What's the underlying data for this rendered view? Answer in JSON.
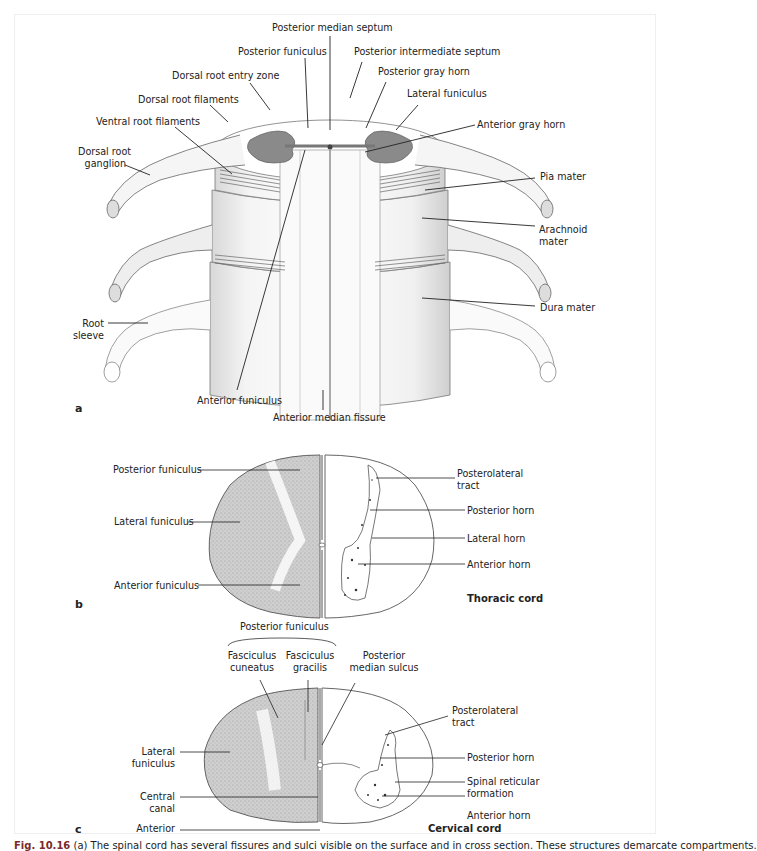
{
  "figure": {
    "panel_a": {
      "letter": "a",
      "labels": {
        "posterior_median_septum": "Posterior median septum",
        "posterior_funiculus": "Posterior funiculus",
        "posterior_intermediate_septum": "Posterior intermediate septum",
        "dorsal_root_entry_zone": "Dorsal root entry zone",
        "posterior_gray_horn": "Posterior gray horn",
        "dorsal_root_filaments": "Dorsal root filaments",
        "lateral_funiculus": "Lateral funiculus",
        "ventral_root_filaments": "Ventral root filaments",
        "anterior_gray_horn": "Anterior gray horn",
        "dorsal_root_ganglion_1": "Dorsal root",
        "dorsal_root_ganglion_2": "ganglion",
        "pia_mater": "Pia mater",
        "arachnoid_mater_1": "Arachnoid",
        "arachnoid_mater_2": "mater",
        "dura_mater": "Dura mater",
        "root_sleeve_1": "Root",
        "root_sleeve_2": "sleeve",
        "anterior_funiculus": "Anterior funiculus",
        "anterior_median_fissure": "Anterior median fissure"
      }
    },
    "panel_b": {
      "letter": "b",
      "title": "Thoracic cord",
      "labels": {
        "posterior_funiculus": "Posterior funiculus",
        "lateral_funiculus": "Lateral funiculus",
        "anterior_funiculus": "Anterior funiculus",
        "posterolateral_tract_1": "Posterolateral",
        "posterolateral_tract_2": "tract",
        "posterior_horn": "Posterior horn",
        "lateral_horn": "Lateral horn",
        "anterior_horn": "Anterior horn"
      }
    },
    "panel_c": {
      "letter": "c",
      "title": "Cervical cord",
      "labels": {
        "posterior_funiculus": "Posterior funiculus",
        "fasciculus_cuneatus_1": "Fasciculus",
        "fasciculus_cuneatus_2": "cuneatus",
        "fasciculus_gracilis_1": "Fasciculus",
        "fasciculus_gracilis_2": "gracilis",
        "posterior_median_sulcus_1": "Posterior",
        "posterior_median_sulcus_2": "median sulcus",
        "posterolateral_tract_1": "Posterolateral",
        "posterolateral_tract_2": "tract",
        "lateral_funiculus_1": "Lateral",
        "lateral_funiculus_2": "funiculus",
        "posterior_horn": "Posterior horn",
        "central_canal_1": "Central",
        "central_canal_2": "canal",
        "spinal_reticular_1": "Spinal reticular",
        "spinal_reticular_2": "formation",
        "anterior_median_fissure_1": "Anterior",
        "anterior_median_fissure_2": "median fissure",
        "anterior_horn": "Anterior horn"
      }
    },
    "caption": {
      "figure_number": "Fig. 10.16",
      "text": " (a) The spinal cord has several fissures and sulci visible on the surface and in cross section. These structures demarcate compartments."
    }
  }
}
